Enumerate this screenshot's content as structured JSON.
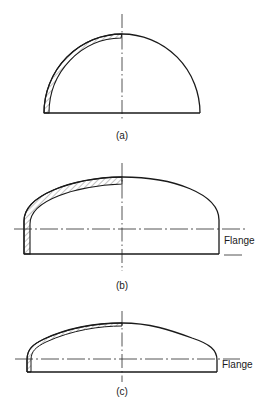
{
  "figure": {
    "type": "technical drawing",
    "panels": [
      {
        "id": "a",
        "caption": "(a)",
        "shape": "hemispherical head"
      },
      {
        "id": "b",
        "caption": "(b)",
        "shape": "ellipsoidal head with flange",
        "annotation": "Flange"
      },
      {
        "id": "c",
        "caption": "(c)",
        "shape": "torispherical head with flange",
        "annotation": "Flange"
      }
    ]
  },
  "colors": {
    "line": "#1a1a1a",
    "background": "#ffffff"
  }
}
